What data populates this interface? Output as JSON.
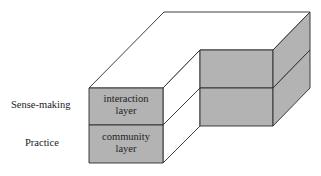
{
  "diagram": {
    "type": "3d-layered-block",
    "row_labels": {
      "top": "Sense-making",
      "bottom": "Practice"
    },
    "front_block": {
      "top_layer": {
        "line1": "interaction",
        "line2": "layer"
      },
      "bottom_layer": {
        "line1": "community",
        "line2": "layer"
      }
    },
    "colors": {
      "shaded_face": "#b3b3b3",
      "white_face": "#ffffff",
      "stroke": "#2a2a2a",
      "text": "#222222"
    }
  }
}
